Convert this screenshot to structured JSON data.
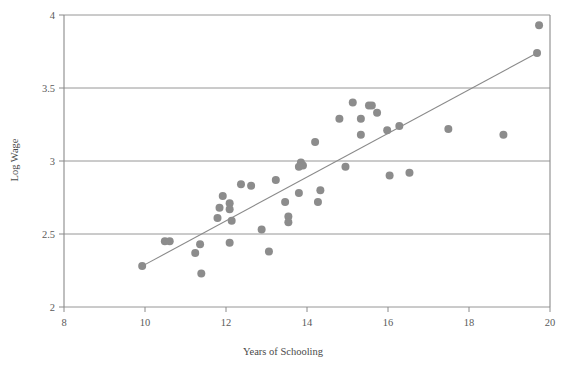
{
  "chart_data": {
    "type": "scatter",
    "title": "",
    "xlabel": "Years of Schooling",
    "ylabel": "Log Wage",
    "xlim": [
      8,
      20
    ],
    "ylim": [
      2,
      4
    ],
    "xticks": [
      "8",
      "10",
      "12",
      "14",
      "16",
      "18",
      "20"
    ],
    "yticks": [
      "2",
      "2.5",
      "3",
      "3.5",
      "4"
    ],
    "grid": "horizontal",
    "legend": "none",
    "point_color": "#8c8c8c",
    "line_color": "#8a8a8a",
    "axis_color": "#8a8a8a",
    "points": [
      {
        "x": 9.93,
        "y": 2.28
      },
      {
        "x": 10.49,
        "y": 2.45
      },
      {
        "x": 10.61,
        "y": 2.45
      },
      {
        "x": 11.24,
        "y": 2.37
      },
      {
        "x": 11.36,
        "y": 2.43
      },
      {
        "x": 11.39,
        "y": 2.23
      },
      {
        "x": 12.09,
        "y": 2.44
      },
      {
        "x": 11.92,
        "y": 2.76
      },
      {
        "x": 11.84,
        "y": 2.68
      },
      {
        "x": 12.09,
        "y": 2.71
      },
      {
        "x": 12.09,
        "y": 2.67
      },
      {
        "x": 11.79,
        "y": 2.61
      },
      {
        "x": 12.14,
        "y": 2.59
      },
      {
        "x": 12.37,
        "y": 2.84
      },
      {
        "x": 12.62,
        "y": 2.83
      },
      {
        "x": 13.23,
        "y": 2.87
      },
      {
        "x": 12.88,
        "y": 2.53
      },
      {
        "x": 13.06,
        "y": 2.38
      },
      {
        "x": 13.46,
        "y": 2.72
      },
      {
        "x": 13.54,
        "y": 2.62
      },
      {
        "x": 13.54,
        "y": 2.58
      },
      {
        "x": 13.85,
        "y": 2.99
      },
      {
        "x": 13.9,
        "y": 2.97
      },
      {
        "x": 13.8,
        "y": 2.96
      },
      {
        "x": 13.8,
        "y": 2.78
      },
      {
        "x": 14.33,
        "y": 2.8
      },
      {
        "x": 14.27,
        "y": 2.72
      },
      {
        "x": 14.95,
        "y": 2.96
      },
      {
        "x": 16.04,
        "y": 2.9
      },
      {
        "x": 14.2,
        "y": 3.13
      },
      {
        "x": 14.8,
        "y": 3.29
      },
      {
        "x": 15.33,
        "y": 3.29
      },
      {
        "x": 15.53,
        "y": 3.38
      },
      {
        "x": 15.13,
        "y": 3.4
      },
      {
        "x": 15.6,
        "y": 3.38
      },
      {
        "x": 15.73,
        "y": 3.33
      },
      {
        "x": 15.33,
        "y": 3.18
      },
      {
        "x": 16.28,
        "y": 3.24
      },
      {
        "x": 15.98,
        "y": 3.21
      },
      {
        "x": 16.53,
        "y": 2.92
      },
      {
        "x": 17.49,
        "y": 3.22
      },
      {
        "x": 18.85,
        "y": 3.18
      },
      {
        "x": 19.73,
        "y": 3.93
      },
      {
        "x": 19.68,
        "y": 3.74
      }
    ],
    "trendline": {
      "x0": 9.93,
      "y0": 2.28,
      "x1": 19.68,
      "y1": 3.74
    }
  },
  "labels": {
    "xaxis_title": "Years of Schooling",
    "yaxis_title": "Log Wage"
  }
}
